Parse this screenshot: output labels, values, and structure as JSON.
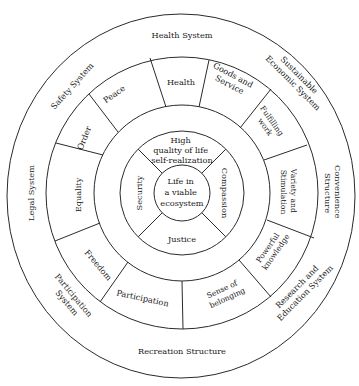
{
  "diagram": {
    "type": "concentric-circle-diagram",
    "center": {
      "label_lines": [
        "Life in",
        "a viable",
        "ecosystem"
      ]
    },
    "inner_ring": [
      {
        "label_lines": [
          "High",
          "quality of life",
          "self-realization"
        ]
      },
      {
        "label_lines": [
          "Compassion"
        ]
      },
      {
        "label_lines": [
          "Justice"
        ]
      },
      {
        "label_lines": [
          "Security"
        ]
      }
    ],
    "middle_ring": [
      {
        "label_lines": [
          "Health"
        ]
      },
      {
        "label_lines": [
          "Goods and",
          "Service"
        ]
      },
      {
        "label_lines": [
          "Fulfilling",
          "work"
        ]
      },
      {
        "label_lines": [
          "Variety and",
          "Stimulation"
        ]
      },
      {
        "label_lines": [
          "Powerful",
          "knowledge"
        ]
      },
      {
        "label_lines": [
          "Sense of",
          "belonging"
        ]
      },
      {
        "label_lines": [
          "Participation"
        ]
      },
      {
        "label_lines": [
          "Freedom"
        ]
      },
      {
        "label_lines": [
          "Equality"
        ]
      },
      {
        "label_lines": [
          "Order"
        ]
      },
      {
        "label_lines": [
          "Peace"
        ]
      }
    ],
    "outer_ring": [
      {
        "label_lines": [
          "Health System"
        ]
      },
      {
        "label_lines": [
          "Sustainable",
          "Economic System"
        ]
      },
      {
        "label_lines": [
          "Convenience",
          "Structure"
        ]
      },
      {
        "label_lines": [
          "Research and",
          "Education System"
        ]
      },
      {
        "label_lines": [
          "Recreation Structure"
        ]
      },
      {
        "label_lines": [
          "Participation",
          "System"
        ]
      },
      {
        "label_lines": [
          "Legal System"
        ]
      },
      {
        "label_lines": [
          "Safety System"
        ]
      }
    ]
  }
}
